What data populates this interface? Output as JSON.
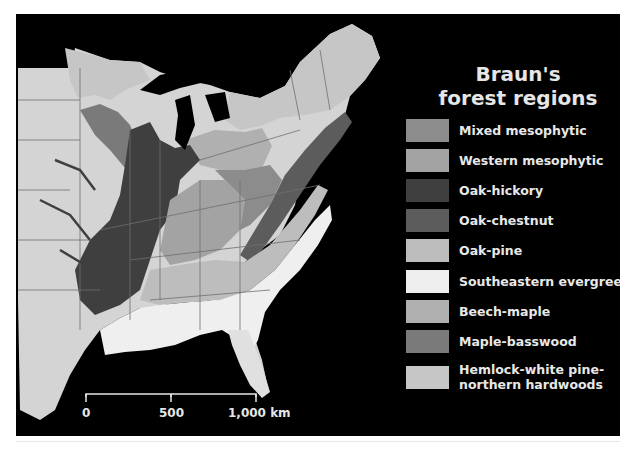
{
  "legend": {
    "title_line1": "Braun's",
    "title_line2": "forest regions",
    "items": [
      {
        "label": "Mixed mesophytic",
        "color": "#8c8c8c"
      },
      {
        "label": "Western mesophytic",
        "color": "#a3a3a3"
      },
      {
        "label": "Oak-hickory",
        "color": "#3f3f3f"
      },
      {
        "label": "Oak-chestnut",
        "color": "#5c5c5c"
      },
      {
        "label": "Oak-pine",
        "color": "#bdbdbd"
      },
      {
        "label": "Southeastern evergreen",
        "color": "#efefef"
      },
      {
        "label": "Beech-maple",
        "color": "#b0b0b0"
      },
      {
        "label": "Maple-basswood",
        "color": "#7a7a7a"
      },
      {
        "label": "Hemlock-white pine-",
        "label2": "northern hardwoods",
        "color": "#c6c6c6"
      }
    ]
  },
  "scale": {
    "label_0": "0",
    "label_500": "500",
    "label_1000": "1,000 km"
  },
  "colors": {
    "background": "#000000",
    "non_forest_land": "#d4d4d4",
    "state_borders": "#6e6e6e",
    "text": "#e8e8e8"
  }
}
